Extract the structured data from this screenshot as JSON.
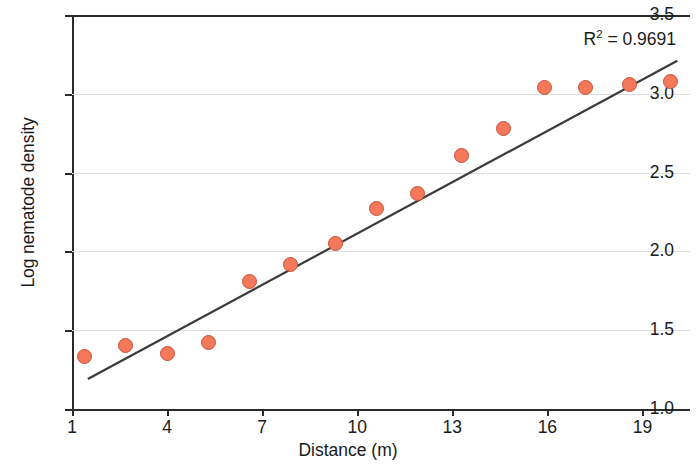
{
  "chart_data": {
    "type": "scatter",
    "title": "",
    "xlabel": "Distance (m)",
    "ylabel": "Log nematode density",
    "xlim": [
      1,
      20.5
    ],
    "ylim": [
      1.0,
      3.5
    ],
    "xticks": [
      1,
      4,
      7,
      10,
      13,
      16,
      19
    ],
    "yticks": [
      1.0,
      1.5,
      2.0,
      2.5,
      3.0,
      3.5
    ],
    "xticklabels": [
      "1",
      "4",
      "7",
      "10",
      "13",
      "16",
      "19"
    ],
    "yticklabels": [
      "1.0",
      "1.5",
      "2.0",
      "2.5",
      "3.0",
      "3.5"
    ],
    "grid": "horizontal",
    "legend": "none",
    "marker_color": "#f4795b",
    "marker_edge_color": "#c8503a",
    "line_color": "#3a3a3a",
    "points": [
      {
        "x": 1.4,
        "y": 1.33
      },
      {
        "x": 2.7,
        "y": 1.4
      },
      {
        "x": 4.0,
        "y": 1.35
      },
      {
        "x": 5.3,
        "y": 1.42
      },
      {
        "x": 6.6,
        "y": 1.81
      },
      {
        "x": 7.9,
        "y": 1.92
      },
      {
        "x": 9.3,
        "y": 2.05
      },
      {
        "x": 10.6,
        "y": 2.27
      },
      {
        "x": 11.9,
        "y": 2.37
      },
      {
        "x": 13.3,
        "y": 2.61
      },
      {
        "x": 14.6,
        "y": 2.78
      },
      {
        "x": 15.9,
        "y": 3.04
      },
      {
        "x": 17.2,
        "y": 3.04
      },
      {
        "x": 18.6,
        "y": 3.06
      },
      {
        "x": 19.9,
        "y": 3.08
      }
    ],
    "trendline": {
      "x0": 1.5,
      "y0": 1.19,
      "x1": 20.1,
      "y1": 3.21
    },
    "annotations": [
      {
        "name": "r-squared",
        "text_prefix": "R",
        "text_superscript": "2",
        "text_suffix": " = 0.9691",
        "full_text": "R2 = 0.9691",
        "x": 18.6,
        "y": 3.35
      }
    ]
  }
}
